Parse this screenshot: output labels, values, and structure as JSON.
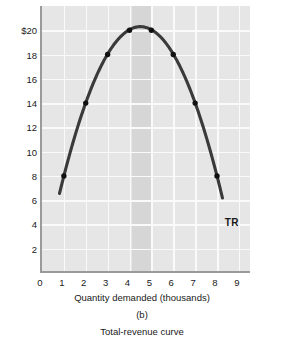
{
  "chart_data": {
    "type": "line",
    "title": "",
    "panel_label": "(b)",
    "caption": "Total-revenue curve",
    "xlabel": "Quantity demanded (thousands)",
    "ylabel": "Total revenue (thousands of dollars)",
    "xlim": [
      0,
      9.6
    ],
    "ylim": [
      0,
      22
    ],
    "xticks": [
      "0",
      "1",
      "2",
      "3",
      "4",
      "5",
      "6",
      "7",
      "8",
      "9"
    ],
    "xtick_values": [
      0,
      1,
      2,
      3,
      4,
      5,
      6,
      7,
      8,
      9
    ],
    "yticks": [
      "2",
      "4",
      "6",
      "8",
      "10",
      "12",
      "14",
      "16",
      "18",
      "$20"
    ],
    "ytick_values": [
      2,
      4,
      6,
      8,
      10,
      12,
      14,
      16,
      18,
      20
    ],
    "grid": true,
    "legend_position": "inline-right",
    "series": [
      {
        "name": "TR",
        "label": "TR",
        "x": [
          1,
          2,
          3,
          4,
          5,
          6,
          7,
          8
        ],
        "values": [
          8,
          14,
          18,
          20,
          20,
          18,
          14,
          8
        ],
        "markers": true,
        "curve_start": {
          "x": 0.8,
          "y": 5
        },
        "curve_end": {
          "x": 8.25,
          "y": 5
        },
        "vertex": {
          "x": 4.5,
          "y": 20.3
        },
        "color": "#3a3a3a"
      }
    ],
    "annotations": [
      {
        "name": "highlight-band",
        "type": "vspan",
        "x_start": 4.1,
        "x_end": 5.05,
        "color": "#d6d6d6"
      }
    ],
    "colors": {
      "plot_background": "#e6e6e6",
      "gridline": "#fafafa",
      "axis": "#9a9a9a",
      "curve": "#3a3a3a",
      "marker": "#111111",
      "band": "#d6d6d6",
      "text": "#1a1a1a"
    }
  }
}
